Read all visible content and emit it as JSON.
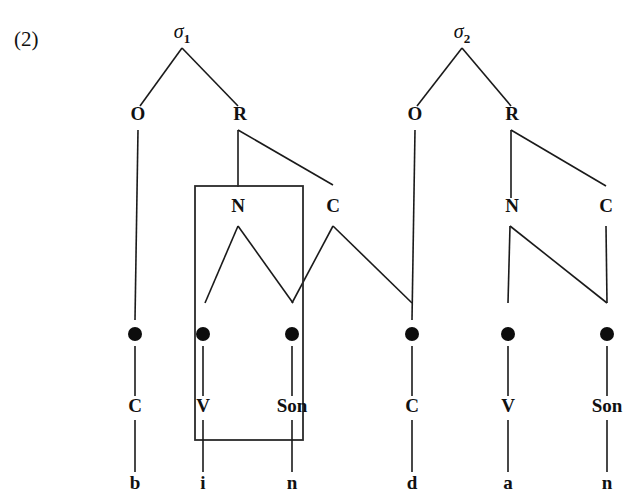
{
  "example_number": "(2)",
  "colors": {
    "ink": "#111111",
    "line": "#1a1a1a",
    "box": "#2a2a2a",
    "background": "#ffffff"
  },
  "syllables": [
    {
      "id": "sigma-1",
      "label": "σ",
      "subscript": "1",
      "x": 182,
      "y": 38,
      "nodes": [
        {
          "id": "onset-1",
          "label": "O",
          "x": 138,
          "y": 120
        },
        {
          "id": "rhyme-1",
          "label": "R",
          "x": 240,
          "y": 120
        },
        {
          "id": "nucleus-1",
          "label": "N",
          "x": 238,
          "y": 212
        },
        {
          "id": "coda-1",
          "label": "C",
          "x": 333,
          "y": 212
        }
      ]
    },
    {
      "id": "sigma-2",
      "label": "σ",
      "subscript": "2",
      "x": 462,
      "y": 38,
      "nodes": [
        {
          "id": "onset-2",
          "label": "O",
          "x": 415,
          "y": 120
        },
        {
          "id": "rhyme-2",
          "label": "R",
          "x": 512,
          "y": 120
        },
        {
          "id": "nucleus-2",
          "label": "N",
          "x": 512,
          "y": 212
        },
        {
          "id": "coda-2",
          "label": "C",
          "x": 606,
          "y": 212
        }
      ]
    }
  ],
  "skeletal_tier": {
    "name": "timing-slots",
    "y": 334,
    "radius": 7,
    "slots": [
      {
        "id": "x-slot-1",
        "x": 135,
        "tier_label": "C",
        "segment": "b"
      },
      {
        "id": "x-slot-2",
        "x": 203,
        "tier_label": "V",
        "segment": "i"
      },
      {
        "id": "x-slot-3",
        "x": 292,
        "tier_label": "Son",
        "segment": "n"
      },
      {
        "id": "x-slot-4",
        "x": 412,
        "tier_label": "C",
        "segment": "d"
      },
      {
        "id": "x-slot-5",
        "x": 508,
        "tier_label": "V",
        "segment": "a"
      },
      {
        "id": "x-slot-6",
        "x": 607,
        "tier_label": "Son",
        "segment": "n"
      }
    ],
    "tier_label_y": 412,
    "segment_y": 489
  },
  "highlight_box": {
    "name": "rhyme-domain-box",
    "x": 195,
    "y": 186,
    "width": 108,
    "height": 254
  },
  "tree_edges": [
    {
      "id": "s1-to-O",
      "from": [
        182,
        48
      ],
      "to": [
        140,
        106
      ]
    },
    {
      "id": "s1-to-R",
      "from": [
        182,
        48
      ],
      "to": [
        238,
        106
      ]
    },
    {
      "id": "O1-to-x1",
      "from": [
        138,
        130
      ],
      "to": [
        135,
        320
      ]
    },
    {
      "id": "R1-to-N",
      "from": [
        238,
        130
      ],
      "to": [
        238,
        187
      ]
    },
    {
      "id": "R1-to-C",
      "from": [
        238,
        130
      ],
      "to": [
        333,
        185
      ]
    },
    {
      "id": "N1-to-x2",
      "from": [
        238,
        226
      ],
      "to": [
        205,
        303
      ]
    },
    {
      "id": "N1-to-x3",
      "from": [
        238,
        226
      ],
      "to": [
        293,
        303
      ]
    },
    {
      "id": "C1-to-x3",
      "from": [
        333,
        226
      ],
      "to": [
        292,
        303
      ]
    },
    {
      "id": "C1-to-x4",
      "from": [
        333,
        226
      ],
      "to": [
        412,
        303
      ]
    },
    {
      "id": "s2-to-O",
      "from": [
        462,
        48
      ],
      "to": [
        417,
        106
      ]
    },
    {
      "id": "s2-to-R",
      "from": [
        462,
        48
      ],
      "to": [
        511,
        106
      ]
    },
    {
      "id": "O2-to-x4",
      "from": [
        415,
        130
      ],
      "to": [
        412,
        320
      ]
    },
    {
      "id": "R2-to-N",
      "from": [
        511,
        130
      ],
      "to": [
        511,
        198
      ]
    },
    {
      "id": "R2-to-C",
      "from": [
        511,
        130
      ],
      "to": [
        606,
        186
      ]
    },
    {
      "id": "N2-to-x5",
      "from": [
        510,
        226
      ],
      "to": [
        508,
        303
      ]
    },
    {
      "id": "N2-to-x6",
      "from": [
        510,
        226
      ],
      "to": [
        607,
        303
      ]
    },
    {
      "id": "C2-to-x6",
      "from": [
        606,
        226
      ],
      "to": [
        607,
        303
      ]
    }
  ],
  "tier_edges": [
    {
      "id": "x1-to-C",
      "from": [
        135,
        346
      ],
      "to": [
        135,
        396
      ]
    },
    {
      "id": "x2-to-V",
      "from": [
        203,
        346
      ],
      "to": [
        203,
        396
      ]
    },
    {
      "id": "x3-to-S",
      "from": [
        292,
        346
      ],
      "to": [
        292,
        396
      ]
    },
    {
      "id": "x4-to-C",
      "from": [
        412,
        346
      ],
      "to": [
        412,
        396
      ]
    },
    {
      "id": "x5-to-V",
      "from": [
        508,
        346
      ],
      "to": [
        508,
        396
      ]
    },
    {
      "id": "x6-to-S",
      "from": [
        607,
        346
      ],
      "to": [
        607,
        396
      ]
    },
    {
      "id": "C-to-b",
      "from": [
        135,
        420
      ],
      "to": [
        135,
        472
      ]
    },
    {
      "id": "V-to-i",
      "from": [
        203,
        420
      ],
      "to": [
        203,
        472
      ]
    },
    {
      "id": "S-to-n",
      "from": [
        292,
        420
      ],
      "to": [
        292,
        472
      ]
    },
    {
      "id": "C-to-d",
      "from": [
        412,
        420
      ],
      "to": [
        412,
        472
      ]
    },
    {
      "id": "V-to-a",
      "from": [
        508,
        420
      ],
      "to": [
        508,
        472
      ]
    },
    {
      "id": "S-to-n2",
      "from": [
        607,
        420
      ],
      "to": [
        607,
        472
      ]
    }
  ]
}
